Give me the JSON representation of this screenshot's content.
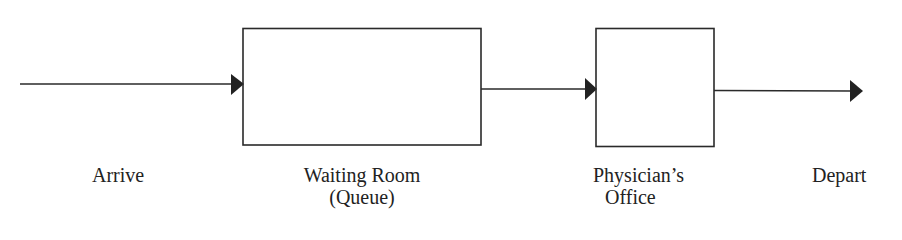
{
  "diagram": {
    "type": "queue-flow",
    "line_color": "#2a2a2a",
    "nodes": [
      {
        "id": "arrive",
        "label": "Arrive",
        "kind": "source"
      },
      {
        "id": "waiting-room",
        "label_line1": "Waiting Room",
        "label_line2": "(Queue)",
        "kind": "queue"
      },
      {
        "id": "physicians-office",
        "label_line1": "Physician’s",
        "label_line2": "Office",
        "kind": "server"
      },
      {
        "id": "depart",
        "label": "Depart",
        "kind": "sink"
      }
    ],
    "edges": [
      {
        "from": "arrive",
        "to": "waiting-room"
      },
      {
        "from": "waiting-room",
        "to": "physicians-office"
      },
      {
        "from": "physicians-office",
        "to": "depart"
      }
    ]
  }
}
